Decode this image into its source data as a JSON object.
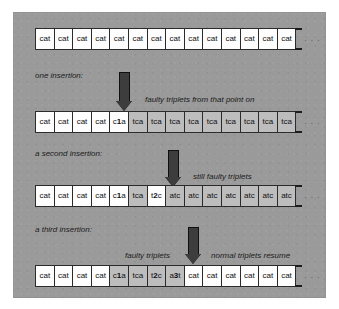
{
  "figure": {
    "panel_color": "#9a9a9a",
    "cell_fill": "#fdfdfd",
    "cell_shaded_fill": "#bdbdbd",
    "arrow_color": "#3d3d3d",
    "border_color": "#2b2b2b",
    "ellipsis": ". . ."
  },
  "rows": [
    {
      "id": "row-original",
      "label": "",
      "cells": [
        {
          "text": "cat",
          "shaded": false
        },
        {
          "text": "cat",
          "shaded": false
        },
        {
          "text": "cat",
          "shaded": false
        },
        {
          "text": "cat",
          "shaded": false
        },
        {
          "text": "cat",
          "shaded": false
        },
        {
          "text": "cat",
          "shaded": false
        },
        {
          "text": "cat",
          "shaded": false
        },
        {
          "text": "cat",
          "shaded": false
        },
        {
          "text": "cat",
          "shaded": false
        },
        {
          "text": "cat",
          "shaded": false
        },
        {
          "text": "cat",
          "shaded": false
        },
        {
          "text": "cat",
          "shaded": false
        },
        {
          "text": "cat",
          "shaded": false
        },
        {
          "text": "cat",
          "shaded": false
        }
      ]
    },
    {
      "id": "row-one-insertion",
      "label": "one insertion:",
      "note": "faulty triplets from that point on",
      "cells": [
        {
          "text": "cat",
          "shaded": false
        },
        {
          "text": "cat",
          "shaded": false
        },
        {
          "text": "cat",
          "shaded": false
        },
        {
          "text": "cat",
          "shaded": false
        },
        {
          "text": "c1a",
          "shaded": false,
          "bold_index": 1
        },
        {
          "text": "tca",
          "shaded": true
        },
        {
          "text": "tca",
          "shaded": true
        },
        {
          "text": "tca",
          "shaded": true
        },
        {
          "text": "tca",
          "shaded": true
        },
        {
          "text": "tca",
          "shaded": true
        },
        {
          "text": "tca",
          "shaded": true
        },
        {
          "text": "tca",
          "shaded": true
        },
        {
          "text": "tca",
          "shaded": true
        },
        {
          "text": "tca",
          "shaded": true
        }
      ]
    },
    {
      "id": "row-second-insertion",
      "label": "a second insertion:",
      "note": "still faulty triplets",
      "cells": [
        {
          "text": "cat",
          "shaded": false
        },
        {
          "text": "cat",
          "shaded": false
        },
        {
          "text": "cat",
          "shaded": false
        },
        {
          "text": "cat",
          "shaded": false
        },
        {
          "text": "c1a",
          "shaded": false,
          "bold_index": 1
        },
        {
          "text": "tca",
          "shaded": true
        },
        {
          "text": "t2c",
          "shaded": false,
          "bold_index": 1
        },
        {
          "text": "atc",
          "shaded": true
        },
        {
          "text": "atc",
          "shaded": true
        },
        {
          "text": "atc",
          "shaded": true
        },
        {
          "text": "atc",
          "shaded": true
        },
        {
          "text": "atc",
          "shaded": true
        },
        {
          "text": "atc",
          "shaded": true
        },
        {
          "text": "atc",
          "shaded": true
        }
      ]
    },
    {
      "id": "row-third-insertion",
      "label": "a third insertion:",
      "note_left": "faulty triplets",
      "note_right": "normal triplets resume",
      "cells": [
        {
          "text": "cat",
          "shaded": false
        },
        {
          "text": "cat",
          "shaded": false
        },
        {
          "text": "cat",
          "shaded": false
        },
        {
          "text": "cat",
          "shaded": false
        },
        {
          "text": "c1a",
          "shaded": true,
          "bold_index": 1
        },
        {
          "text": "tca",
          "shaded": true
        },
        {
          "text": "t2c",
          "shaded": true,
          "bold_index": 1
        },
        {
          "text": "a3t",
          "shaded": true,
          "bold_index": 1
        },
        {
          "text": "cat",
          "shaded": false
        },
        {
          "text": "cat",
          "shaded": false
        },
        {
          "text": "cat",
          "shaded": false
        },
        {
          "text": "cat",
          "shaded": false
        },
        {
          "text": "cat",
          "shaded": false
        },
        {
          "text": "cat",
          "shaded": false
        }
      ]
    }
  ],
  "labels": {
    "one_insertion": "one insertion:",
    "faulty_from_point": "faulty triplets from that point on",
    "second_insertion": "a second insertion:",
    "still_faulty": "still faulty triplets",
    "third_insertion": "a third insertion:",
    "faulty_triplets": "faulty triplets",
    "normal_resume": "normal triplets resume"
  }
}
